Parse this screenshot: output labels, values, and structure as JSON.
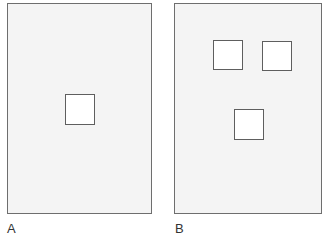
{
  "panels": [
    {
      "label": "A",
      "squares": 1
    },
    {
      "label": "B",
      "squares": 3
    }
  ],
  "colors": {
    "panel_fill": "#f4f4f4",
    "border": "#6e6e6e",
    "square_fill": "#ffffff"
  }
}
